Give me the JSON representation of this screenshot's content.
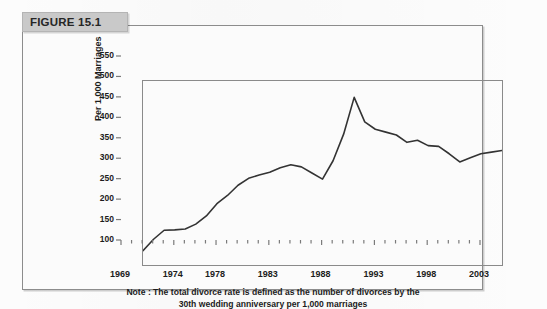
{
  "figure": {
    "banner_label": "FIGURE 15.1"
  },
  "note": {
    "line1": "Note : The total divorce rate is defined as the number of divorces by the",
    "line2": "30th wedding anniversary per 1,000 marriages"
  },
  "colors": {
    "line": "#333333",
    "axis": "#8a8a8a",
    "banner_bg": "#c9c9c9",
    "panel_border": "#8c8c8c",
    "text": "#1c1c1c"
  },
  "chart_data": {
    "type": "line",
    "title": "FIGURE 15.1",
    "xlabel": "",
    "ylabel": "Per 1,000 Marriages",
    "xlim": [
      1969,
      2003
    ],
    "ylim": [
      100,
      550
    ],
    "grid": false,
    "legend": null,
    "y_ticks": [
      100,
      150,
      200,
      250,
      300,
      350,
      400,
      450,
      500,
      550
    ],
    "x_tick_labels": [
      1969,
      1974,
      1978,
      1983,
      1988,
      1993,
      1998,
      2003
    ],
    "x_minor_ticks_every": 1,
    "annotation": "Note : The total divorce rate is defined as the number of divorces by the 30th wedding anniversary per 1,000 marriages",
    "series": [
      {
        "name": "Total divorce rate",
        "x": [
          1969,
          1970,
          1971,
          1972,
          1973,
          1974,
          1975,
          1976,
          1977,
          1978,
          1979,
          1980,
          1981,
          1982,
          1983,
          1984,
          1985,
          1986,
          1987,
          1988,
          1989,
          1990,
          1991,
          1992,
          1993,
          1994,
          1995,
          1996,
          1997,
          1998,
          1999,
          2000,
          2001,
          2002,
          2003
        ],
        "values": [
          135,
          163,
          185,
          186,
          188,
          200,
          220,
          250,
          270,
          295,
          312,
          320,
          327,
          338,
          345,
          340,
          325,
          310,
          355,
          420,
          510,
          450,
          432,
          425,
          418,
          400,
          405,
          392,
          390,
          372,
          352,
          362,
          372,
          376,
          380
        ]
      }
    ]
  }
}
